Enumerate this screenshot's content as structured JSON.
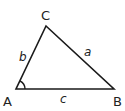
{
  "diagram": {
    "type": "triangle",
    "stroke_color": "#1a1a1a",
    "vertices": [
      {
        "id": "A",
        "label": "A",
        "x": 16,
        "y": 89
      },
      {
        "id": "B",
        "label": "B",
        "x": 114,
        "y": 89
      },
      {
        "id": "C",
        "label": "C",
        "x": 46,
        "y": 26
      }
    ],
    "sides": [
      {
        "id": "a",
        "label": "a",
        "between": [
          "B",
          "C"
        ]
      },
      {
        "id": "b",
        "label": "b",
        "between": [
          "A",
          "C"
        ]
      },
      {
        "id": "c",
        "label": "c",
        "between": [
          "A",
          "B"
        ]
      }
    ],
    "angle_marker": {
      "vertex": "A"
    }
  }
}
